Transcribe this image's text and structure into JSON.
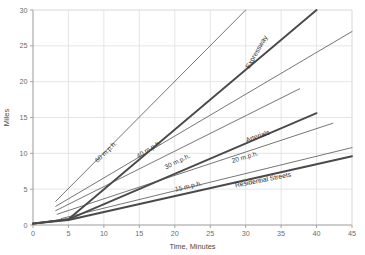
{
  "chart_data": {
    "type": "line",
    "title": "",
    "xlabel": "Time, Minutes",
    "ylabel": "Miles",
    "xlim": [
      0,
      45
    ],
    "ylim": [
      0,
      30
    ],
    "xticks": [
      "0",
      "5",
      "10",
      "15",
      "20",
      "25",
      "30",
      "35",
      "40",
      "45"
    ],
    "yticks": [
      "0",
      "5",
      "10",
      "15",
      "20",
      "25",
      "30"
    ],
    "grid": true,
    "legend_position": "inline-along-lines",
    "series": [
      {
        "name": "60 m.p.h.",
        "style": "thin",
        "speed_mph": 60,
        "x": [
          3.2,
          30.0
        ],
        "y": [
          3.3,
          30.0
        ]
      },
      {
        "name": "40 m.p.h.",
        "style": "thin",
        "speed_mph": 40,
        "x": [
          3.2,
          45.0
        ],
        "y": [
          2.6,
          27.0
        ]
      },
      {
        "name": "30 m.p.h.",
        "style": "thin",
        "speed_mph": 30,
        "x": [
          3.2,
          37.6
        ],
        "y": [
          2.0,
          19.0
        ]
      },
      {
        "name": "20 m.p.h.",
        "style": "thin",
        "speed_mph": 20,
        "x": [
          3.4,
          42.3
        ],
        "y": [
          1.5,
          14.2
        ]
      },
      {
        "name": "15 m.p.h.",
        "style": "thin",
        "speed_mph": 15,
        "x": [
          4.0,
          45.0
        ],
        "y": [
          0.9,
          10.8
        ]
      },
      {
        "name": "Expressway",
        "style": "thick",
        "x": [
          0.0,
          5.0,
          40.0
        ],
        "y": [
          0.2,
          0.8,
          30.0
        ]
      },
      {
        "name": "Arterials",
        "style": "thick",
        "x": [
          0.0,
          5.0,
          40.0
        ],
        "y": [
          0.2,
          0.8,
          15.6
        ]
      },
      {
        "name": "Residential Streets",
        "style": "thick",
        "x": [
          0.0,
          5.0,
          45.0
        ],
        "y": [
          0.2,
          0.7,
          9.6
        ]
      }
    ],
    "annotations": [
      {
        "text": "60 m.p.h.",
        "x": 10.5,
        "y": 10.0,
        "rotation": -44
      },
      {
        "text": "40 m.p.h.",
        "x": 16.5,
        "y": 10.3,
        "rotation": -32
      },
      {
        "text": "30 m.p.h.",
        "x": 20.5,
        "y": 8.6,
        "rotation": -26
      },
      {
        "text": "20 m.p.h.",
        "x": 30.0,
        "y": 9.2,
        "rotation": -17
      },
      {
        "text": "15 m.p.h.",
        "x": 22.0,
        "y": 5.1,
        "rotation": -13
      },
      {
        "text": "Expressway",
        "x": 31.8,
        "y": 24.0,
        "rotation": -60
      },
      {
        "text": "Arterials",
        "x": 31.8,
        "y": 12.1,
        "rotation": -20
      },
      {
        "text": "Residential Streets",
        "x": 32.5,
        "y": 6.0,
        "rotation": -11
      }
    ],
    "colors": {
      "background": "#ffffff",
      "gridline": "#e2e2e2",
      "axis": "#9a9a9a",
      "thin_line": "#5d5d5d",
      "thick_line": "#4a4a4a",
      "tick_text": "#6b6b6b",
      "axis_title": "#4a4a4a"
    }
  }
}
